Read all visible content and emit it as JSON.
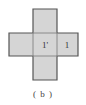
{
  "diagram": {
    "type": "cube-net-cross",
    "fill_color": "#d5d5d5",
    "outline_color": "#555555",
    "inner_line_color": "#8a8a8a",
    "faces": [
      {
        "id": "top",
        "label": ""
      },
      {
        "id": "left",
        "label": ""
      },
      {
        "id": "center",
        "label": "1'"
      },
      {
        "id": "right",
        "label": "1"
      },
      {
        "id": "bottom",
        "label": ""
      }
    ],
    "caption": "( b )"
  }
}
